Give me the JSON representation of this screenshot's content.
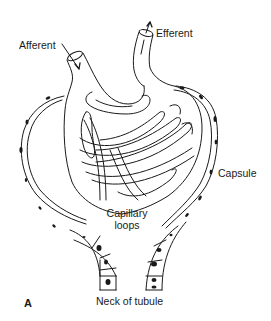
{
  "figure": {
    "panel_letter": "A",
    "labels": {
      "afferent": "Afferent",
      "efferent": "Efferent",
      "capsule": "Capsule",
      "capillary_loops_line1": "Capillary",
      "capillary_loops_line2": "loops",
      "neck_of_tubule": "Neck of tubule"
    },
    "colors": {
      "stroke": "#1a1a1a",
      "background": "#ffffff"
    }
  }
}
